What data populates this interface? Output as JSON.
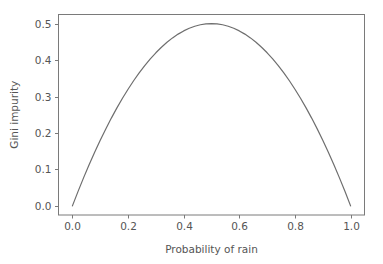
{
  "chart_data": {
    "type": "line",
    "title": "",
    "xlabel": "Probability of rain",
    "ylabel": "Gini impurity",
    "xlim": [
      -0.05,
      1.05
    ],
    "ylim": [
      -0.025,
      0.525
    ],
    "xticks": [
      "0.0",
      "0.2",
      "0.4",
      "0.6",
      "0.8",
      "1.0"
    ],
    "xtick_values": [
      0.0,
      0.2,
      0.4,
      0.6,
      0.8,
      1.0
    ],
    "yticks": [
      "0.0",
      "0.1",
      "0.2",
      "0.3",
      "0.4",
      "0.5"
    ],
    "ytick_values": [
      0.0,
      0.1,
      0.2,
      0.3,
      0.4,
      0.5
    ],
    "grid": false,
    "legend": null,
    "series": [
      {
        "name": "Gini impurity",
        "formula": "2p(1-p)",
        "color": "#6e6e6e",
        "linewidth": 1.2,
        "x": [
          0.0,
          0.02,
          0.04,
          0.06,
          0.08,
          0.1,
          0.12,
          0.14,
          0.16,
          0.18,
          0.2,
          0.22,
          0.24,
          0.26,
          0.28,
          0.3,
          0.32,
          0.34,
          0.36,
          0.38,
          0.4,
          0.42,
          0.44,
          0.46,
          0.48,
          0.5,
          0.52,
          0.54,
          0.56,
          0.58,
          0.6,
          0.62,
          0.64,
          0.66,
          0.68,
          0.7,
          0.72,
          0.74,
          0.76,
          0.78,
          0.8,
          0.82,
          0.84,
          0.86,
          0.88,
          0.9,
          0.92,
          0.94,
          0.96,
          0.98,
          1.0
        ],
        "values": [
          0.0,
          0.0392,
          0.0768,
          0.1128,
          0.1472,
          0.18,
          0.2112,
          0.2408,
          0.2688,
          0.2952,
          0.32,
          0.3432,
          0.3648,
          0.3848,
          0.4032,
          0.42,
          0.4352,
          0.4488,
          0.4608,
          0.4712,
          0.48,
          0.4872,
          0.4928,
          0.4968,
          0.4992,
          0.5,
          0.4992,
          0.4968,
          0.4928,
          0.4872,
          0.48,
          0.4712,
          0.4608,
          0.4488,
          0.4352,
          0.42,
          0.4032,
          0.3848,
          0.3648,
          0.3432,
          0.32,
          0.2952,
          0.2688,
          0.2408,
          0.2112,
          0.18,
          0.1472,
          0.1128,
          0.0768,
          0.0392,
          0.0
        ]
      }
    ],
    "peak": {
      "x": 0.5,
      "y": 0.5
    },
    "colors": {
      "line": "#6e6e6e",
      "spine": "#7a7a7a",
      "tick_label": "#555555",
      "background": "#ffffff"
    }
  }
}
